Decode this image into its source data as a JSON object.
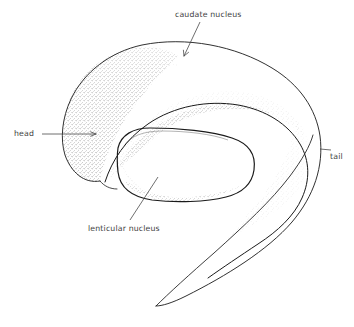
{
  "figure": {
    "background_color": "#ffffff",
    "ink_color": "#1a1a1a",
    "label_color": "#3d3d3d",
    "width": 354,
    "height": 327
  },
  "labels": {
    "caudate_nucleus": "caudate nucleus",
    "head": "head",
    "tail": "tail",
    "lenticular_nucleus": "lenticular nucleus"
  },
  "structures": {
    "caudate_nucleus": {
      "name": "caudate nucleus",
      "description": "Large C-shaped body arching from lower-left head, over the top, curving down the right side into a long tapering tail",
      "parts": [
        "head",
        "body",
        "tail"
      ]
    },
    "lenticular_nucleus": {
      "name": "lenticular nucleus",
      "description": "Rounded lens-shaped mass nested below and inside the arc of the caudate nucleus"
    }
  },
  "leaders": {
    "caudate_nucleus": {
      "type": "arrow",
      "direction": "down-left",
      "from": [
        199,
        22
      ],
      "to": [
        184,
        55
      ]
    },
    "head": {
      "type": "arrow",
      "direction": "right",
      "from": [
        42,
        134
      ],
      "to": [
        95,
        134
      ]
    },
    "tail": {
      "type": "tick",
      "direction": "left",
      "from": [
        330,
        150
      ],
      "to": [
        318,
        149
      ]
    },
    "lenticular_nucleus": {
      "type": "line",
      "direction": "up-right",
      "from": [
        131,
        219
      ],
      "to": [
        157,
        178
      ]
    }
  }
}
